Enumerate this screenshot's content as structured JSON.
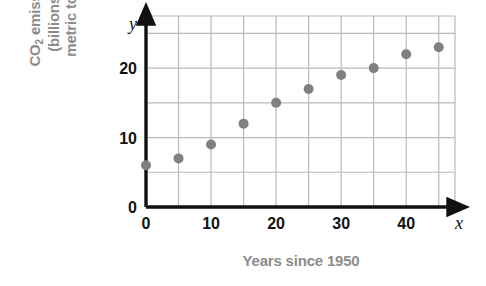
{
  "chart_data": {
    "type": "scatter",
    "title": "",
    "xlabel": "Years since 1950",
    "ylabel_lines": [
      "CO",
      "2",
      " emissions",
      "(billions of",
      "metric tons)"
    ],
    "ylabel": "CO2 emissions (billions of metric tons)",
    "x_axis_variable": "x",
    "y_axis_variable": "y",
    "xlim": [
      0,
      47.5
    ],
    "ylim": [
      0,
      27.5
    ],
    "x_ticks": [
      0,
      10,
      20,
      30,
      40
    ],
    "x_tick_labels": [
      "0",
      "10",
      "20",
      "30",
      "40"
    ],
    "y_ticks": [
      0,
      10,
      20
    ],
    "y_tick_labels": [
      "0",
      "10",
      "20"
    ],
    "x_gridline_step": 5,
    "y_gridline_step": 5,
    "grid": true,
    "legend": false,
    "marker_color": "#808080",
    "gridline_color": "#b9b9b9",
    "axis_color": "#111111",
    "label_color": "#8c8c8c",
    "x": [
      0,
      5,
      10,
      15,
      20,
      25,
      30,
      35,
      40,
      45
    ],
    "values": [
      6,
      7,
      9,
      12,
      15,
      17,
      19,
      20,
      22,
      23
    ],
    "points": [
      {
        "x": 0,
        "y": 6
      },
      {
        "x": 5,
        "y": 7
      },
      {
        "x": 10,
        "y": 9
      },
      {
        "x": 15,
        "y": 12
      },
      {
        "x": 20,
        "y": 15
      },
      {
        "x": 25,
        "y": 17
      },
      {
        "x": 30,
        "y": 19
      },
      {
        "x": 35,
        "y": 20
      },
      {
        "x": 40,
        "y": 22
      },
      {
        "x": 45,
        "y": 23
      }
    ]
  },
  "y_axis_title": {
    "line1_prefix": "CO",
    "line1_sub": "2",
    "line1_suffix": " emissions",
    "line2": "(billions of",
    "line3": "metric tons)"
  },
  "x_axis_title": {
    "text": "Years since 1950"
  }
}
